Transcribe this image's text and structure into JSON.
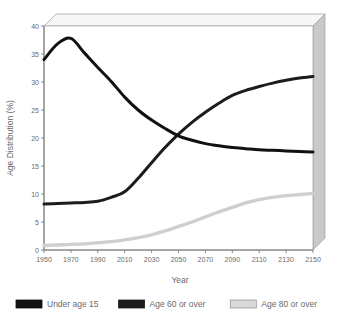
{
  "chart_data": {
    "type": "line",
    "title": "",
    "xlabel": "Year",
    "ylabel": "Age Distribution (%)",
    "xlim": [
      1950,
      2150
    ],
    "ylim": [
      0,
      40
    ],
    "xticks": [
      1950,
      1970,
      1990,
      2010,
      2030,
      2050,
      2070,
      2090,
      2110,
      2130,
      2150
    ],
    "yticks": [
      0,
      5,
      10,
      15,
      20,
      25,
      30,
      35,
      40
    ],
    "grid": false,
    "legend_position": "bottom",
    "x": [
      1950,
      1960,
      1970,
      1980,
      1990,
      2000,
      2010,
      2020,
      2030,
      2040,
      2050,
      2060,
      2070,
      2080,
      2090,
      2100,
      2110,
      2120,
      2130,
      2140,
      2150
    ],
    "series": [
      {
        "name": "Under age 15",
        "color": "#111111",
        "values": [
          34.0,
          36.8,
          37.8,
          35.2,
          32.6,
          30.1,
          27.3,
          25.0,
          23.2,
          21.7,
          20.4,
          19.6,
          19.0,
          18.6,
          18.3,
          18.1,
          17.9,
          17.8,
          17.7,
          17.6,
          17.5
        ]
      },
      {
        "name": "Age 60 or over",
        "color": "#1c1c1c",
        "values": [
          8.2,
          8.3,
          8.4,
          8.5,
          8.7,
          9.4,
          10.4,
          12.8,
          15.6,
          18.3,
          20.7,
          22.8,
          24.6,
          26.2,
          27.6,
          28.5,
          29.2,
          29.8,
          30.3,
          30.7,
          31.0
        ]
      },
      {
        "name": "Age 80 or over",
        "color": "#cfcfcf",
        "values": [
          0.8,
          0.9,
          1.0,
          1.1,
          1.3,
          1.5,
          1.8,
          2.2,
          2.7,
          3.4,
          4.2,
          5.0,
          5.9,
          6.8,
          7.6,
          8.4,
          9.0,
          9.4,
          9.7,
          9.9,
          10.1
        ]
      }
    ],
    "legend": [
      {
        "label": "Under age 15",
        "swatch": "#111111",
        "border": "#111111"
      },
      {
        "label": "Age 60 or over",
        "swatch": "#1c1c1c",
        "border": "#1c1c1c"
      },
      {
        "label": "Age 80 or over",
        "swatch": "#d8d8d8",
        "border": "#9a9a9a"
      }
    ],
    "colors": {
      "plot_background": "#ffffff",
      "wall_top": "#f4f4f4",
      "wall_right": "#c9c9c9",
      "axis": "#7a7a7a",
      "text": "#6a6a6a"
    }
  }
}
